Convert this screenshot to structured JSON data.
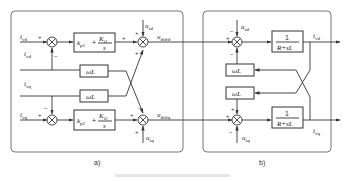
{
  "figure": {
    "panel_a": {
      "label": "a)",
      "inputs": {
        "id_ref": {
          "base": "i",
          "sub": "vd",
          "sup": "−*"
        },
        "id_fb": {
          "base": "i",
          "sub": "vd",
          "sup": "−"
        },
        "iq_fb": {
          "base": "i",
          "sub": "vq",
          "sup": "−"
        },
        "iq_ref": {
          "base": "i",
          "sub": "vq",
          "sup": "−*"
        },
        "usd": {
          "base": "u",
          "sub": "sd",
          "sup": "−"
        },
        "usq": {
          "base": "u",
          "sub": "sq",
          "sup": "−"
        }
      },
      "outputs": {
        "ud": {
          "base": "u",
          "sub": "diffd",
          "sup": "−*"
        },
        "uq": {
          "base": "u",
          "sub": "diffq",
          "sup": "−*"
        }
      },
      "blocks": {
        "pi1": {
          "kp": "k",
          "kp_sub": "p1",
          "kp_sup": "n",
          "ki": "K",
          "ki_sub": "i1",
          "ki_sup": "n",
          "den": "s"
        },
        "pi2": {
          "kp": "k",
          "kp_sub": "p2",
          "kp_sup": "n",
          "ki": "K",
          "ki_sub": "i2",
          "ki_sup": "n",
          "den": "s"
        },
        "wl_top": "ωL",
        "wl_bottom": "ωL"
      },
      "signs": {
        "sum1": [
          "+",
          "−"
        ],
        "sum2": [
          "+",
          "+",
          "+"
        ],
        "sum3": [
          "+",
          "−"
        ],
        "sum4": [
          "+",
          "−",
          "+"
        ]
      }
    },
    "panel_b": {
      "label": "b)",
      "blocks": {
        "plant_d": {
          "num": "1",
          "den": "R+sL"
        },
        "plant_q": {
          "num": "1",
          "den": "R+sL"
        },
        "wl_top": "ωL",
        "wl_bottom": "ωL"
      },
      "inputs": {
        "usd": {
          "base": "u",
          "sub": "sd",
          "sup": "−"
        },
        "usq": {
          "base": "u",
          "sub": "sq",
          "sup": "−"
        }
      },
      "outputs": {
        "id": {
          "base": "i",
          "sub": "vd",
          "sup": "−"
        },
        "iq": {
          "base": "i",
          "sub": "vq",
          "sup": "−"
        }
      },
      "signs": {
        "sum_d": [
          "+",
          "−",
          "−"
        ],
        "sum_q": [
          "+",
          "+",
          "−"
        ]
      }
    },
    "caption": ""
  }
}
